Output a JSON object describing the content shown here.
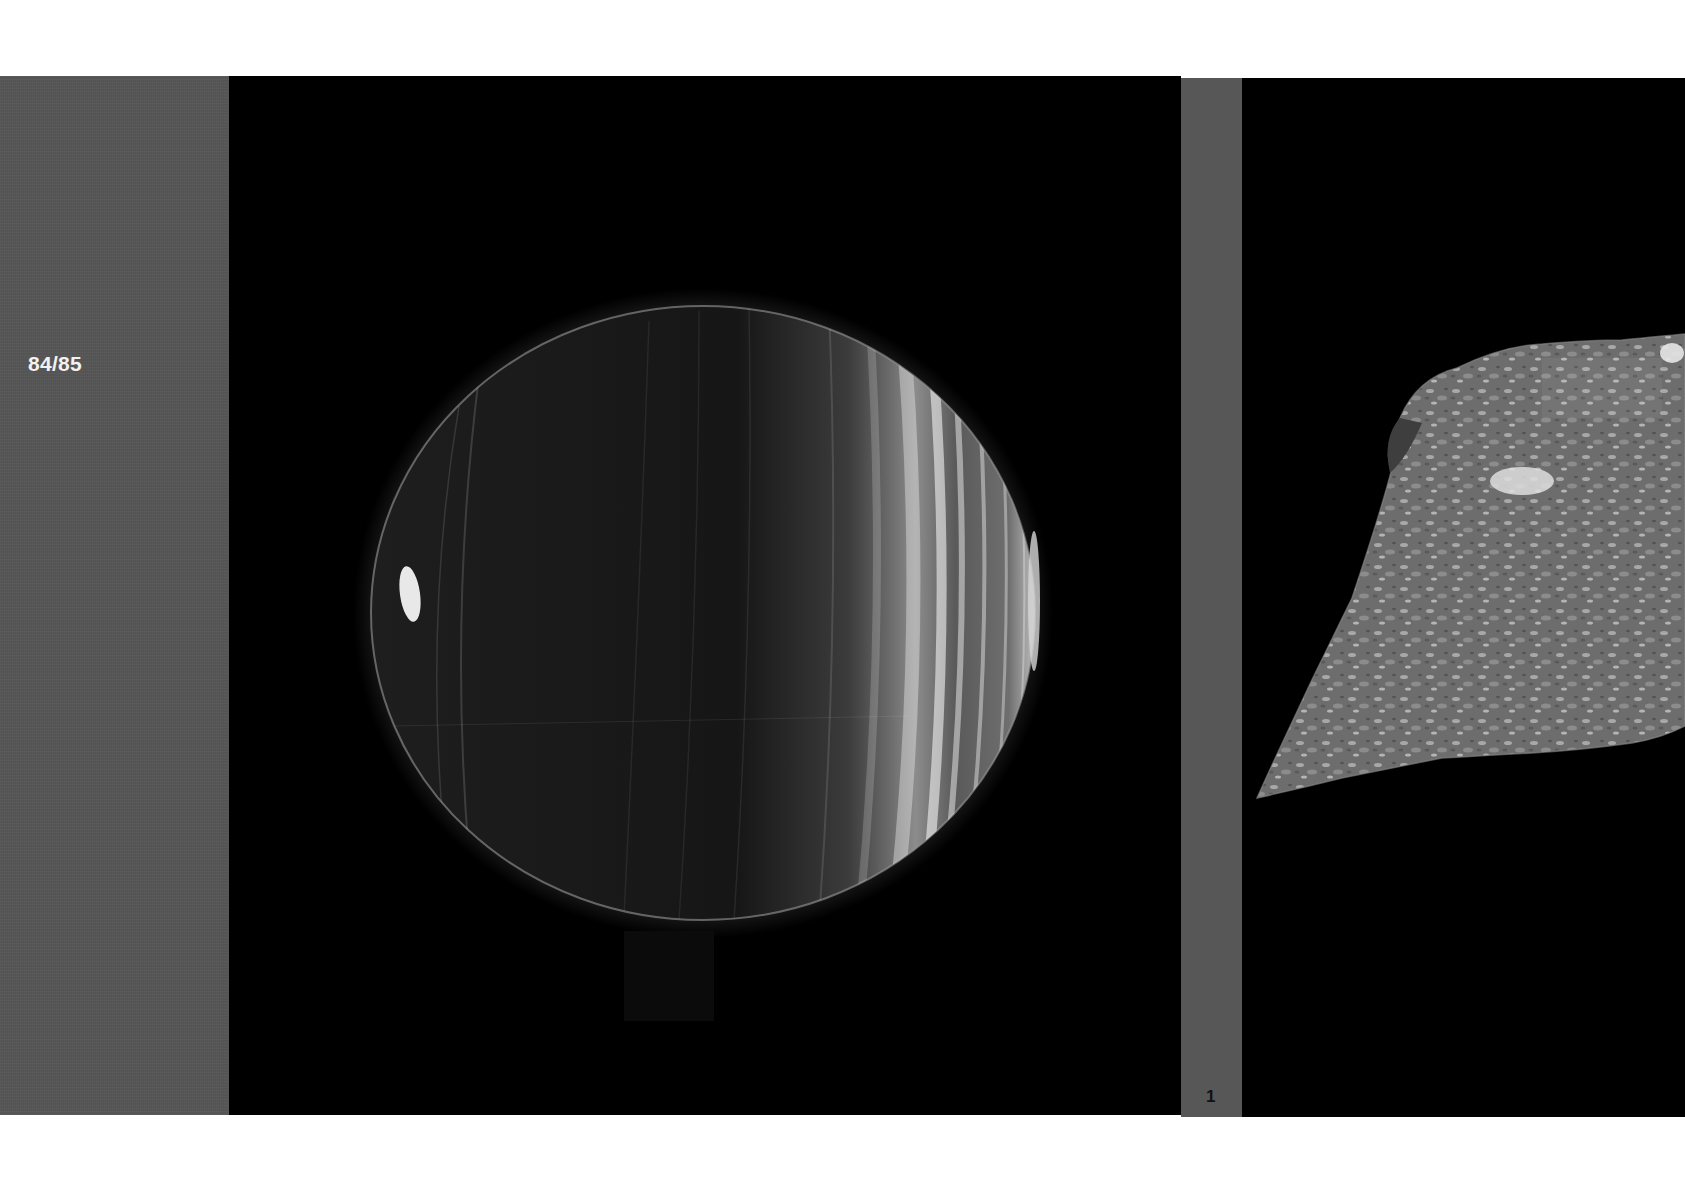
{
  "page": {
    "page_number": "84/85",
    "figure_number": "1"
  },
  "images": {
    "left": {
      "subject": "banded-planet-sphere",
      "description": "Dark globe with bright vertical streak bands on the right side and a small bright spot near the left limb"
    },
    "right": {
      "subject": "textured-surface-relief",
      "description": "Grey mottled terrain surface rendered in perspective against black background"
    }
  },
  "colors": {
    "margin_gray": "#565656",
    "panel_black": "#000000",
    "page_white": "#ffffff",
    "page_number_text": "#f2f2f2"
  }
}
